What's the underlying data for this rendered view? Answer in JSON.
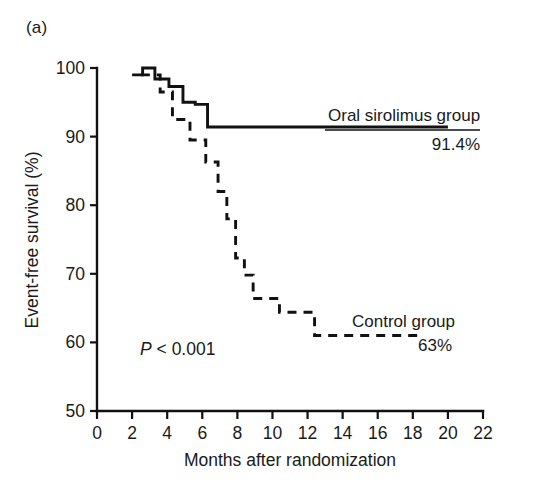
{
  "figure": {
    "panel_label": "(a)",
    "pvalue": "P < 0.001",
    "pvalue_symbol": "P",
    "pvalue_rest": " < 0.001"
  },
  "chart_data": {
    "type": "line",
    "title": "",
    "subtitle": "",
    "xlabel": "Months after randomization",
    "ylabel": "Event-free survival (%)",
    "xlim": [
      0,
      22
    ],
    "ylim": [
      50,
      100
    ],
    "xticks": [
      0,
      2,
      4,
      6,
      8,
      10,
      12,
      14,
      16,
      18,
      20,
      22
    ],
    "xticklabels": [
      "0",
      "2",
      "4",
      "6",
      "8",
      "10",
      "12",
      "14",
      "16",
      "18",
      "20",
      "22"
    ],
    "yticks": [
      50,
      60,
      70,
      80,
      90,
      100
    ],
    "yticklabels": [
      "50",
      "60",
      "70",
      "80",
      "90",
      "100"
    ],
    "grid": false,
    "legend_position": "inline-annotation",
    "annotations": [
      {
        "text": "P < 0.001",
        "x": 4.2,
        "y": 60.5
      }
    ],
    "series": [
      {
        "name": "Oral sirolimus group",
        "label": "Oral sirolimus group",
        "linestyle": "solid",
        "color": "#111111",
        "endpoint_label": "91.4%",
        "endpoint_value": 91.4,
        "x": [
          2.0,
          2.6,
          2.6,
          3.3,
          3.3,
          4.1,
          4.1,
          4.9,
          4.9,
          5.6,
          5.6,
          6.3,
          6.3,
          20.0
        ],
        "y": [
          99.0,
          99.0,
          100.0,
          100.0,
          98.4,
          98.4,
          97.3,
          97.3,
          95.0,
          95.0,
          94.7,
          94.7,
          91.4,
          91.4
        ]
      },
      {
        "name": "Control group",
        "label": "Control group",
        "linestyle": "dashed",
        "color": "#111111",
        "endpoint_label": "63%",
        "endpoint_value": 63.0,
        "x": [
          2.5,
          3.6,
          3.6,
          4.3,
          4.3,
          5.3,
          5.3,
          6.2,
          6.2,
          6.9,
          6.9,
          7.4,
          7.4,
          7.9,
          7.9,
          8.4,
          8.4,
          8.9,
          8.9,
          10.4,
          10.4,
          12.4,
          12.4,
          18.6
        ],
        "y": [
          99.0,
          99.0,
          96.5,
          96.5,
          92.5,
          92.5,
          89.5,
          89.5,
          86.3,
          86.3,
          82.0,
          82.0,
          78.0,
          78.0,
          72.3,
          72.3,
          69.8,
          69.8,
          66.4,
          66.4,
          64.4,
          64.4,
          61.0,
          61.0
        ]
      }
    ]
  }
}
